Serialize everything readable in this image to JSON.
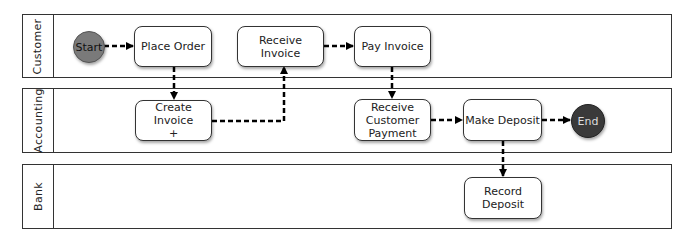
{
  "diagram": {
    "type": "swimlane-flowchart",
    "lanes": [
      {
        "label": "Customer"
      },
      {
        "label": "Accounting"
      },
      {
        "label": "Bank"
      }
    ],
    "nodes": {
      "start": {
        "label": "Start",
        "lane": "Customer",
        "shape": "circle",
        "color": "#7a7a7a"
      },
      "place_order": {
        "label": "Place Order",
        "lane": "Customer"
      },
      "receive_invoice": {
        "label": "Receive Invoice",
        "lane": "Customer"
      },
      "pay_invoice": {
        "label": "Pay Invoice",
        "lane": "Customer"
      },
      "create_invoice": {
        "label": "Create Invoice\n+",
        "lane": "Accounting"
      },
      "receive_payment": {
        "label": "Receive\nCustomer\nPayment",
        "lane": "Accounting"
      },
      "make_deposit": {
        "label": "Make Deposit",
        "lane": "Accounting"
      },
      "end": {
        "label": "End",
        "lane": "Accounting",
        "shape": "circle",
        "color": "#3a3a3a"
      },
      "record_deposit": {
        "label": "Record\nDeposit",
        "lane": "Bank"
      }
    },
    "edges": [
      {
        "from": "Start",
        "to": "Place Order"
      },
      {
        "from": "Place Order",
        "to": "Create Invoice"
      },
      {
        "from": "Create Invoice",
        "to": "Receive Invoice"
      },
      {
        "from": "Receive Invoice",
        "to": "Pay Invoice"
      },
      {
        "from": "Pay Invoice",
        "to": "Receive Customer Payment"
      },
      {
        "from": "Receive Customer Payment",
        "to": "Make Deposit"
      },
      {
        "from": "Make Deposit",
        "to": "End"
      },
      {
        "from": "Make Deposit",
        "to": "Record Deposit"
      }
    ],
    "edge_style": "dashed-arrow"
  }
}
